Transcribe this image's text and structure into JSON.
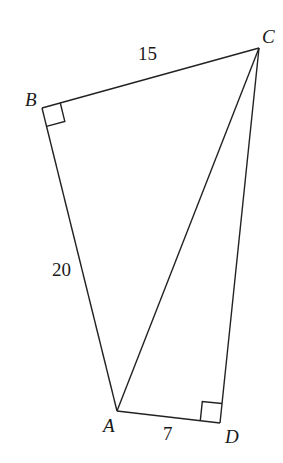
{
  "diagram": {
    "type": "quadrilateral-with-diagonal",
    "points": {
      "A": {
        "label": "A",
        "x": 117,
        "y": 411
      },
      "B": {
        "label": "B",
        "x": 42,
        "y": 108
      },
      "C": {
        "label": "C",
        "x": 259,
        "y": 48
      },
      "D": {
        "label": "D",
        "x": 220,
        "y": 423
      }
    },
    "segments": [
      {
        "from": "B",
        "to": "C",
        "length_label": "15"
      },
      {
        "from": "B",
        "to": "A",
        "length_label": "20"
      },
      {
        "from": "A",
        "to": "D",
        "length_label": "7"
      },
      {
        "from": "D",
        "to": "C",
        "length_label": ""
      },
      {
        "from": "A",
        "to": "C",
        "length_label": ""
      }
    ],
    "right_angles": [
      "B",
      "D"
    ],
    "labels": {
      "A": "A",
      "B": "B",
      "C": "C",
      "D": "D",
      "BC": "15",
      "AB": "20",
      "AD": "7"
    }
  }
}
